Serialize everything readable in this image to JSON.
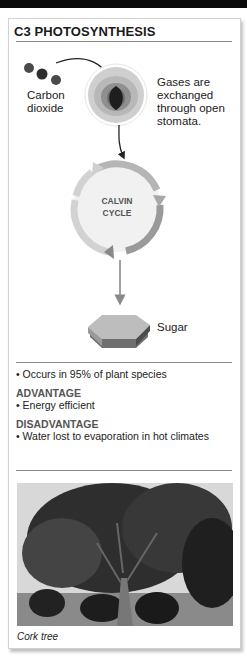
{
  "title": "C3 PHOTOSYNTHESIS",
  "diagram": {
    "co2_label_line1": "Carbon",
    "co2_label_line2": "dioxide",
    "stomata_label_line1": "Gases are",
    "stomata_label_line2": "exchanged",
    "stomata_label_line3": "through open",
    "stomata_label_line4": "stomata.",
    "cycle_label_line1": "CALVIN",
    "cycle_label_line2": "CYCLE",
    "product_label": "Sugar"
  },
  "facts": {
    "occurrence": "• Occurs in 95% of plant species",
    "advantage_heading": "ADVANTAGE",
    "advantage_item": "• Energy efficient",
    "disadvantage_heading": "DISADVANTAGE",
    "disadvantage_item": "• Water lost to evaporation in hot climates"
  },
  "photo": {
    "caption": "Cork tree"
  }
}
